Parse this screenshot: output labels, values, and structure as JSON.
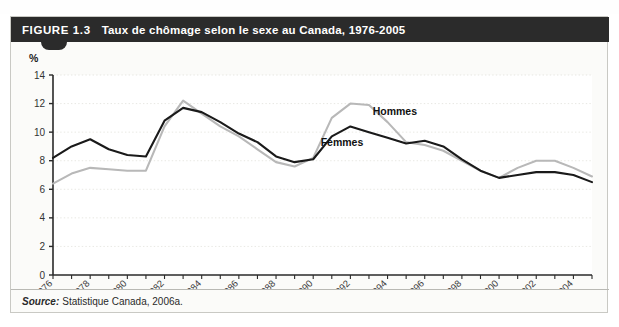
{
  "figure": {
    "number": "FIGURE 1.3",
    "title": "Taux de chômage selon le sexe au Canada, 1976-2005",
    "source_label": "Source:",
    "source_text": "Statistique Canada, 2006a."
  },
  "colors": {
    "header_bg": "#2b2b2b",
    "header_text": "#ffffff",
    "femmes_line": "#1a1a1a",
    "hommes_line": "#b8b8b8",
    "grid": "#e2e2dc",
    "axis": "#2a2a2a",
    "panel_bg": "#ffffff",
    "figure_bg": "#fbfbf9"
  },
  "chart_data": {
    "type": "line",
    "title": "Taux de chômage selon le sexe au Canada, 1976-2005",
    "xlabel": "",
    "ylabel": "%",
    "ylim": [
      0,
      14
    ],
    "ytick_step": 2,
    "yticks": [
      "0",
      "2",
      "4",
      "6",
      "8",
      "10",
      "12",
      "14"
    ],
    "xlim": [
      1976,
      2005
    ],
    "grid": true,
    "grid_axis": "y",
    "legend_position": "inline-annotations",
    "x": [
      1976,
      1977,
      1978,
      1979,
      1980,
      1981,
      1982,
      1983,
      1984,
      1985,
      1986,
      1987,
      1988,
      1989,
      1990,
      1991,
      1992,
      1993,
      1994,
      1995,
      1996,
      1997,
      1998,
      1999,
      2000,
      2001,
      2002,
      2003,
      2004,
      2005
    ],
    "xticks": [
      "1976",
      "1978",
      "1980",
      "1982",
      "1984",
      "1986",
      "1988",
      "1990",
      "1992",
      "1994",
      "1996",
      "1998",
      "2000",
      "2002",
      "2004"
    ],
    "series": [
      {
        "name": "Femmes",
        "color": "#1a1a1a",
        "values": [
          8.2,
          9.0,
          9.5,
          8.8,
          8.4,
          8.3,
          10.8,
          11.7,
          11.4,
          10.7,
          9.9,
          9.3,
          8.3,
          7.9,
          8.1,
          9.7,
          10.4,
          10.0,
          9.6,
          9.2,
          9.4,
          9.0,
          8.1,
          7.3,
          6.8,
          7.0,
          7.2,
          7.2,
          7.0,
          6.5
        ]
      },
      {
        "name": "Hommes",
        "color": "#b8b8b8",
        "values": [
          6.4,
          7.1,
          7.5,
          7.4,
          7.3,
          7.3,
          10.4,
          12.2,
          11.3,
          10.4,
          9.7,
          8.8,
          7.9,
          7.6,
          8.2,
          11.0,
          12.0,
          11.9,
          10.7,
          9.3,
          9.1,
          8.7,
          8.0,
          7.3,
          6.8,
          7.5,
          8.0,
          8.0,
          7.5,
          6.9
        ]
      }
    ],
    "annotations": [
      {
        "text": "Hommes",
        "series": "Hommes",
        "x": 1993.2,
        "y": 11.2
      },
      {
        "text": "Femmes",
        "series": "Femmes",
        "x": 1990.4,
        "y": 9.0
      }
    ]
  }
}
